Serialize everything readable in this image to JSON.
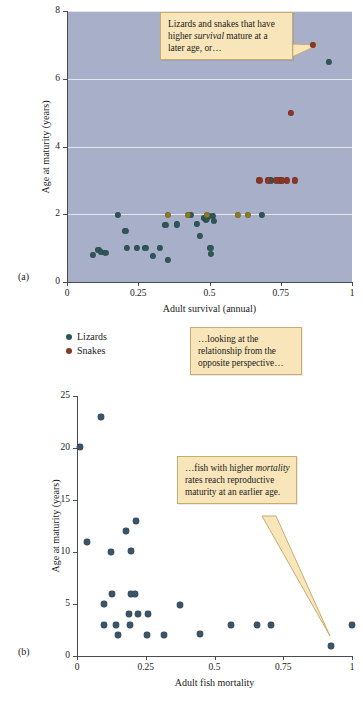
{
  "figure": {
    "background": "#ffffff",
    "plot_background": "#a7afc9",
    "callout_fill": "#f8e6ba",
    "callout_border": "#c9ab6e"
  },
  "panel_a": {
    "label": "(a)",
    "xlabel": "Adult survival (annual)",
    "ylabel": "Age at maturity (years)",
    "xticks": [
      "0",
      "0.25",
      "0.5",
      "0.75",
      "1"
    ],
    "yticks": [
      "0",
      "2",
      "4",
      "6",
      "8"
    ],
    "callout": {
      "pre": "Lizards and snakes that have higher ",
      "em": "survival",
      "post": " mature at a later age, or…"
    },
    "legend": [
      {
        "label": "Lizards",
        "color": "#2f5557"
      },
      {
        "label": "Snakes",
        "color": "#8a3526"
      }
    ]
  },
  "panel_mid_callout": {
    "text": "…looking at the relationship from the opposite perspective…"
  },
  "panel_b": {
    "label": "(b)",
    "xlabel": "Adult fish mortality",
    "ylabel": "Age at maturity (years)",
    "xticks": [
      "0",
      "0.25",
      "0.5",
      "0.75",
      "1"
    ],
    "yticks": [
      "0",
      "5",
      "10",
      "15",
      "20",
      "25"
    ],
    "callout": {
      "pre": "…fish with higher ",
      "em": "mortality",
      "post": " rates reach reproductive maturity at an earlier age."
    }
  },
  "chart_data": [
    {
      "type": "scatter",
      "panel": "a",
      "title": "",
      "xlabel": "Adult survival (annual)",
      "ylabel": "Age at maturity (years)",
      "xlim": [
        0,
        1
      ],
      "ylim": [
        0,
        8
      ],
      "xticks": [
        0,
        0.25,
        0.5,
        0.75,
        1
      ],
      "yticks": [
        0,
        2,
        4,
        6,
        8
      ],
      "grid": "horizontal",
      "legend_position": "below-left",
      "series": [
        {
          "name": "Lizards",
          "color": "#2f5557",
          "points": [
            [
              0.09,
              0.8
            ],
            [
              0.11,
              0.95
            ],
            [
              0.12,
              0.9
            ],
            [
              0.135,
              0.85
            ],
            [
              0.18,
              1.98
            ],
            [
              0.205,
              1.5
            ],
            [
              0.21,
              1.0
            ],
            [
              0.245,
              1.0
            ],
            [
              0.275,
              1.0
            ],
            [
              0.3,
              0.78
            ],
            [
              0.325,
              1.0
            ],
            [
              0.345,
              1.68
            ],
            [
              0.355,
              0.65
            ],
            [
              0.385,
              1.7
            ],
            [
              0.435,
              1.97
            ],
            [
              0.455,
              1.72
            ],
            [
              0.465,
              1.35
            ],
            [
              0.48,
              1.9
            ],
            [
              0.487,
              1.85
            ],
            [
              0.492,
              1.88
            ],
            [
              0.498,
              1.95
            ],
            [
              0.503,
              1.0
            ],
            [
              0.505,
              0.82
            ],
            [
              0.512,
              1.95
            ],
            [
              0.515,
              1.8
            ],
            [
              0.685,
              1.98
            ],
            [
              0.715,
              3.0
            ],
            [
              0.748,
              3.0
            ],
            [
              0.92,
              6.5
            ]
          ]
        },
        {
          "name": "Snakes",
          "color": "#8a3526",
          "points": [
            [
              0.675,
              3.0
            ],
            [
              0.705,
              3.0
            ],
            [
              0.735,
              3.0
            ],
            [
              0.755,
              3.0
            ],
            [
              0.772,
              3.0
            ],
            [
              0.8,
              3.0
            ],
            [
              0.785,
              5.0
            ],
            [
              0.862,
              7.0
            ]
          ]
        },
        {
          "name": "Overlap",
          "color": "#8a7a22",
          "points": [
            [
              0.355,
              1.98
            ],
            [
              0.425,
              1.98
            ],
            [
              0.492,
              1.98
            ],
            [
              0.6,
              1.98
            ],
            [
              0.635,
              1.98
            ]
          ]
        }
      ]
    },
    {
      "type": "scatter",
      "panel": "b",
      "title": "",
      "xlabel": "Adult fish mortality",
      "ylabel": "Age at maturity (years)",
      "xlim": [
        0,
        1
      ],
      "ylim": [
        0,
        25
      ],
      "xticks": [
        0,
        0.25,
        0.5,
        0.75,
        1
      ],
      "yticks": [
        0,
        5,
        10,
        15,
        20,
        25
      ],
      "grid": "horizontal",
      "legend_position": "none",
      "series": [
        {
          "name": "Fish",
          "color": "#3c5468",
          "points": [
            [
              0.012,
              20.1
            ],
            [
              0.088,
              23.0
            ],
            [
              0.037,
              11.0
            ],
            [
              0.125,
              10.0
            ],
            [
              0.195,
              10.1
            ],
            [
              0.178,
              12.0
            ],
            [
              0.215,
              13.0
            ],
            [
              0.128,
              6.0
            ],
            [
              0.195,
              6.0
            ],
            [
              0.212,
              6.0
            ],
            [
              0.098,
              5.0
            ],
            [
              0.375,
              4.9
            ],
            [
              0.188,
              4.0
            ],
            [
              0.222,
              4.0
            ],
            [
              0.258,
              4.0
            ],
            [
              0.098,
              3.0
            ],
            [
              0.143,
              3.0
            ],
            [
              0.192,
              3.0
            ],
            [
              0.56,
              3.0
            ],
            [
              0.655,
              3.0
            ],
            [
              0.705,
              3.0
            ],
            [
              1.0,
              3.0
            ],
            [
              0.148,
              2.0
            ],
            [
              0.253,
              2.0
            ],
            [
              0.315,
              2.0
            ],
            [
              0.447,
              2.1
            ],
            [
              0.922,
              1.0
            ]
          ]
        }
      ]
    }
  ]
}
